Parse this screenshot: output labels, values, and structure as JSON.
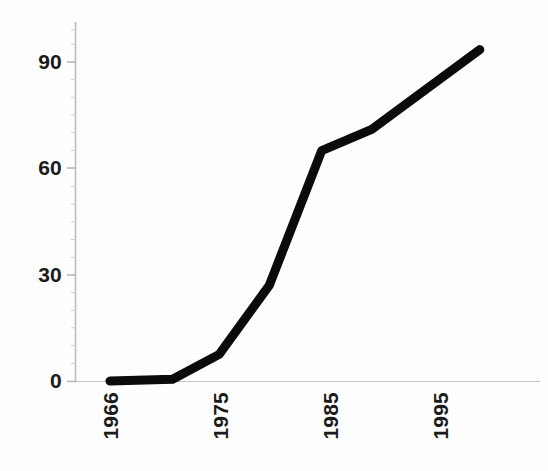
{
  "chart_data": {
    "type": "line",
    "title": "",
    "subtitle": "",
    "xlabel": "",
    "ylabel": "",
    "legend": [],
    "legend_position": "none",
    "grid": false,
    "xlim": [
      1966,
      1999
    ],
    "ylim": [
      0,
      99
    ],
    "x_tick_labels": [
      "1966",
      "1975",
      "1985",
      "1995"
    ],
    "x_tick_values": [
      1966,
      1975,
      1985,
      1995
    ],
    "y_tick_labels": [
      "0",
      "30",
      "60",
      "90"
    ],
    "y_tick_values": [
      0,
      30,
      60,
      90
    ],
    "y_minor_ticks": true,
    "series": [
      {
        "name": "series-1",
        "color": "#0b0b0b",
        "line_width": 9,
        "x": [
          1966,
          1971.5,
          1975.6,
          1980,
          1984.6,
          1989,
          1998.5
        ],
        "values": [
          0,
          0.5,
          7.5,
          27,
          65,
          71,
          93.5
        ]
      }
    ],
    "axis_color": "#b9b9b9",
    "tick_label_color": "#1b1b1b",
    "background": "#ffffff"
  },
  "axes": {
    "y_ticks": [
      {
        "label": "0",
        "top_px": 381
      },
      {
        "label": "30",
        "top_px": 275
      },
      {
        "label": "60",
        "top_px": 168
      },
      {
        "label": "90",
        "top_px": 62
      }
    ],
    "x_ticks": [
      {
        "label": "1966",
        "left_px": 110
      },
      {
        "label": "1975",
        "left_px": 220
      },
      {
        "label": "1985",
        "left_px": 330
      },
      {
        "label": "1995",
        "left_px": 440
      }
    ]
  }
}
